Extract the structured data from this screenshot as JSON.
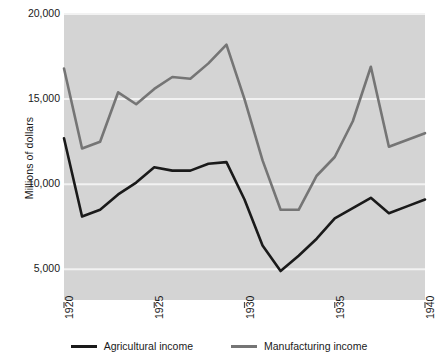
{
  "chart_data": {
    "type": "line",
    "title": "",
    "xlabel": "",
    "ylabel": "Millions of dollars",
    "x": [
      1920,
      1921,
      1922,
      1923,
      1924,
      1925,
      1926,
      1927,
      1928,
      1929,
      1930,
      1931,
      1932,
      1933,
      1934,
      1935,
      1936,
      1937,
      1938,
      1939,
      1940
    ],
    "xlim": [
      1920,
      1940
    ],
    "ylim": [
      3200,
      20000
    ],
    "xticks": [
      1920,
      1925,
      1930,
      1935,
      1940
    ],
    "xtick_labels": [
      "1920",
      "1925",
      "1930",
      "1935",
      "1940"
    ],
    "yticks": [
      5000,
      10000,
      15000,
      20000
    ],
    "ytick_labels": [
      "5,000",
      "10,000",
      "15,000",
      "20,000"
    ],
    "grid": "horizontal",
    "grid_color": "#f2f2f2",
    "plot_background": "#d4d4d4",
    "legend_position": "bottom",
    "series": [
      {
        "name": "Agricultural income",
        "color": "#1a1a1a",
        "values": [
          12700,
          8100,
          8500,
          9400,
          10100,
          11000,
          10800,
          10800,
          11200,
          11300,
          9100,
          6400,
          4900,
          5800,
          6800,
          8000,
          8600,
          9200,
          8300,
          8700,
          9100
        ]
      },
      {
        "name": "Manufacturing income",
        "color": "#757575",
        "values": [
          16800,
          12100,
          12500,
          15400,
          14700,
          15600,
          16300,
          16200,
          17100,
          18200,
          15000,
          11400,
          8500,
          8500,
          10500,
          11600,
          13700,
          16900,
          12200,
          12600,
          13000
        ]
      }
    ]
  },
  "axes": {
    "y_title": "Millions of dollars"
  },
  "legend": {
    "items": [
      {
        "label": "Agricultural income",
        "color": "#1a1a1a"
      },
      {
        "label": "Manufacturing income",
        "color": "#757575"
      }
    ]
  }
}
